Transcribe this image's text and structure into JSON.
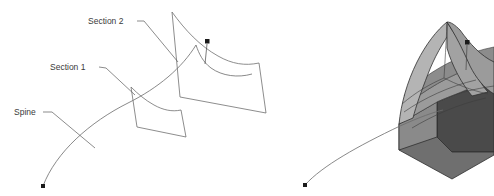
{
  "figure": {
    "background_color": "#ffffff",
    "labels": [
      {
        "id": "section2",
        "text": "Section 2",
        "x": 88,
        "y": 24
      },
      {
        "id": "section1",
        "text": "Section 1",
        "x": 50,
        "y": 70
      },
      {
        "id": "spine",
        "text": "Spine",
        "x": 14,
        "y": 115
      }
    ],
    "colors": {
      "line": "#6b6b6b",
      "text": "#3a3a3a",
      "leader": "#5a5a5a",
      "edge": "#2e2e2e",
      "face_top_light": "#b4b4b4",
      "face_top_mid": "#9b9b9b",
      "face_inner": "#8c8c8c",
      "face_front": "#7d7d7d",
      "face_right_dark": "#4a4a4a",
      "face_side_dark": "#565656",
      "marker": "#1a1a1a"
    },
    "left_view": {
      "name": "wireframe-view",
      "spine_curve": "M 43 186 C 58 150, 92 120, 128 102 C 160 86, 182 66, 196 44",
      "spine_start_marker": {
        "x": 43,
        "y": 186
      },
      "spine_end_marker": {
        "x": 208,
        "y": 44
      },
      "spine_tail": "M 196 44 C 199 52, 202 60, 207 66",
      "section1_outline": "M 131 87 L 137 127 L 186 137 L 180 110 C 166 111, 152 105, 131 87 Z",
      "section2_outline": "M 172 12 L 180 97 L 266 113 L 259 63 C 232 65, 205 52, 172 12 Z"
    },
    "right_view": {
      "name": "shaded-solid-view",
      "spine_curve": "M 305 185 C 322 166, 358 146, 400 126 C 420 117, 434 112, 443 110",
      "spine_start_marker": {
        "x": 305,
        "y": 185
      },
      "pin_marker": {
        "x": 467,
        "y": 43
      },
      "pin_stem": "M 467 45 L 466 68"
    }
  }
}
